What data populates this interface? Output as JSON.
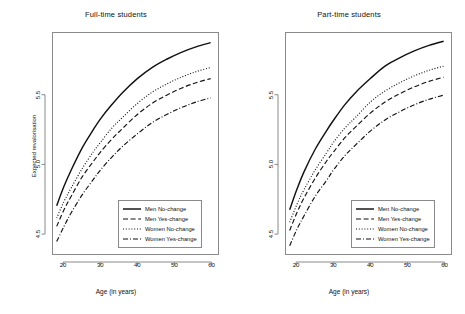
{
  "chart_data": {
    "type": "line",
    "title": "",
    "panels": [
      {
        "title": "Full-time students",
        "xlabel": "Age (in years)",
        "ylabel": "Expected revalorisation",
        "xlim": [
          17,
          62
        ],
        "ylim": [
          4.35,
          5.95
        ],
        "xticks": [
          20,
          30,
          40,
          50,
          60
        ],
        "yticks": [
          4.5,
          5.0,
          5.5
        ],
        "grid": false,
        "legend_position": "bottom-right",
        "x": [
          18,
          20,
          22,
          25,
          28,
          30,
          33,
          36,
          40,
          44,
          48,
          52,
          56,
          60
        ],
        "series": [
          {
            "name": "Men No-change",
            "style": "solid",
            "values": [
              4.7,
              4.84,
              4.96,
              5.12,
              5.25,
              5.33,
              5.43,
              5.52,
              5.62,
              5.7,
              5.76,
              5.81,
              5.85,
              5.88
            ]
          },
          {
            "name": "Women No-change",
            "style": "dotted",
            "values": [
              4.61,
              4.73,
              4.83,
              4.97,
              5.09,
              5.16,
              5.26,
              5.34,
              5.44,
              5.52,
              5.58,
              5.63,
              5.67,
              5.7
            ]
          },
          {
            "name": "Men Yes-change",
            "style": "dashed",
            "values": [
              4.55,
              4.67,
              4.77,
              4.91,
              5.02,
              5.09,
              5.18,
              5.26,
              5.36,
              5.44,
              5.5,
              5.55,
              5.59,
              5.62
            ]
          },
          {
            "name": "Women Yes-change",
            "style": "dashdot",
            "values": [
              4.44,
              4.55,
              4.65,
              4.78,
              4.89,
              4.96,
              5.05,
              5.13,
              5.22,
              5.3,
              5.36,
              5.41,
              5.45,
              5.48
            ]
          }
        ]
      },
      {
        "title": "Part-time students",
        "xlabel": "Age (in years)",
        "ylabel": "",
        "xlim": [
          17,
          62
        ],
        "ylim": [
          4.35,
          5.95
        ],
        "xticks": [
          20,
          30,
          40,
          50,
          60
        ],
        "yticks": [
          4.5,
          5.0,
          5.5
        ],
        "grid": false,
        "legend_position": "bottom-right",
        "x": [
          18,
          20,
          22,
          25,
          28,
          30,
          33,
          36,
          40,
          44,
          48,
          52,
          56,
          60
        ],
        "series": [
          {
            "name": "Men No-change",
            "style": "solid",
            "values": [
              4.67,
              4.82,
              4.95,
              5.11,
              5.24,
              5.32,
              5.43,
              5.52,
              5.62,
              5.71,
              5.77,
              5.82,
              5.86,
              5.89
            ]
          },
          {
            "name": "Women No-change",
            "style": "dotted",
            "values": [
              4.58,
              4.71,
              4.82,
              4.96,
              5.08,
              5.16,
              5.26,
              5.34,
              5.45,
              5.53,
              5.59,
              5.64,
              5.68,
              5.71
            ]
          },
          {
            "name": "Men Yes-change",
            "style": "dashed",
            "values": [
              4.52,
              4.65,
              4.76,
              4.9,
              5.02,
              5.09,
              5.19,
              5.27,
              5.37,
              5.45,
              5.51,
              5.56,
              5.6,
              5.63
            ]
          },
          {
            "name": "Women Yes-change",
            "style": "dashdot",
            "values": [
              4.41,
              4.53,
              4.63,
              4.77,
              4.88,
              4.96,
              5.06,
              5.14,
              5.24,
              5.32,
              5.38,
              5.43,
              5.47,
              5.5
            ]
          }
        ]
      }
    ],
    "legend": [
      {
        "label": "Men No-change",
        "style": "solid"
      },
      {
        "label": "Men Yes-change",
        "style": "dashed"
      },
      {
        "label": "Women No-change",
        "style": "dotted"
      },
      {
        "label": "Women Yes-change",
        "style": "dashdot"
      }
    ],
    "colors": {
      "line": "#111111",
      "frame": "#8a8a8a",
      "background": "#ffffff"
    }
  }
}
